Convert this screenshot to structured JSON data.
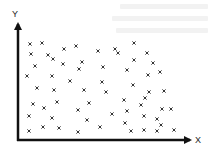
{
  "chart_data": {
    "type": "scatter",
    "title": "",
    "xlabel": "X",
    "ylabel": "Y",
    "grid": false,
    "legend": null,
    "axis_ticks": "none",
    "marker": "x",
    "colors": {
      "axis": "#111111",
      "marker": "#333333",
      "background": "#ffffff"
    },
    "plot_pixel_frame": {
      "origin": [
        18,
        140
      ],
      "x_end": 192,
      "y_end": 22
    },
    "points": [
      [
        30,
        44
      ],
      [
        42,
        43
      ],
      [
        64,
        49
      ],
      [
        76,
        46
      ],
      [
        98,
        51
      ],
      [
        115,
        49
      ],
      [
        134,
        43
      ],
      [
        31,
        54
      ],
      [
        48,
        55
      ],
      [
        53,
        59
      ],
      [
        118,
        53
      ],
      [
        147,
        53
      ],
      [
        35,
        66
      ],
      [
        63,
        64
      ],
      [
        82,
        62
      ],
      [
        134,
        60
      ],
      [
        153,
        63
      ],
      [
        27,
        76
      ],
      [
        52,
        76
      ],
      [
        79,
        69
      ],
      [
        103,
        67
      ],
      [
        127,
        70
      ],
      [
        148,
        75
      ],
      [
        160,
        72
      ],
      [
        70,
        81
      ],
      [
        102,
        82
      ],
      [
        133,
        85
      ],
      [
        37,
        88
      ],
      [
        54,
        90
      ],
      [
        84,
        90
      ],
      [
        106,
        92
      ],
      [
        149,
        92
      ],
      [
        164,
        91
      ],
      [
        145,
        98
      ],
      [
        124,
        100
      ],
      [
        33,
        104
      ],
      [
        57,
        102
      ],
      [
        89,
        103
      ],
      [
        141,
        105
      ],
      [
        44,
        108
      ],
      [
        78,
        110
      ],
      [
        127,
        111
      ],
      [
        162,
        109
      ],
      [
        171,
        109
      ],
      [
        29,
        116
      ],
      [
        112,
        114
      ],
      [
        144,
        116
      ],
      [
        52,
        118
      ],
      [
        87,
        120
      ],
      [
        125,
        123
      ],
      [
        157,
        119
      ],
      [
        161,
        125
      ],
      [
        29,
        131
      ],
      [
        43,
        127
      ],
      [
        59,
        128
      ],
      [
        78,
        132
      ],
      [
        100,
        127
      ],
      [
        131,
        131
      ],
      [
        144,
        130
      ],
      [
        157,
        131
      ],
      [
        174,
        130
      ]
    ]
  },
  "axes": {
    "x_label": "X",
    "y_label": "Y"
  }
}
